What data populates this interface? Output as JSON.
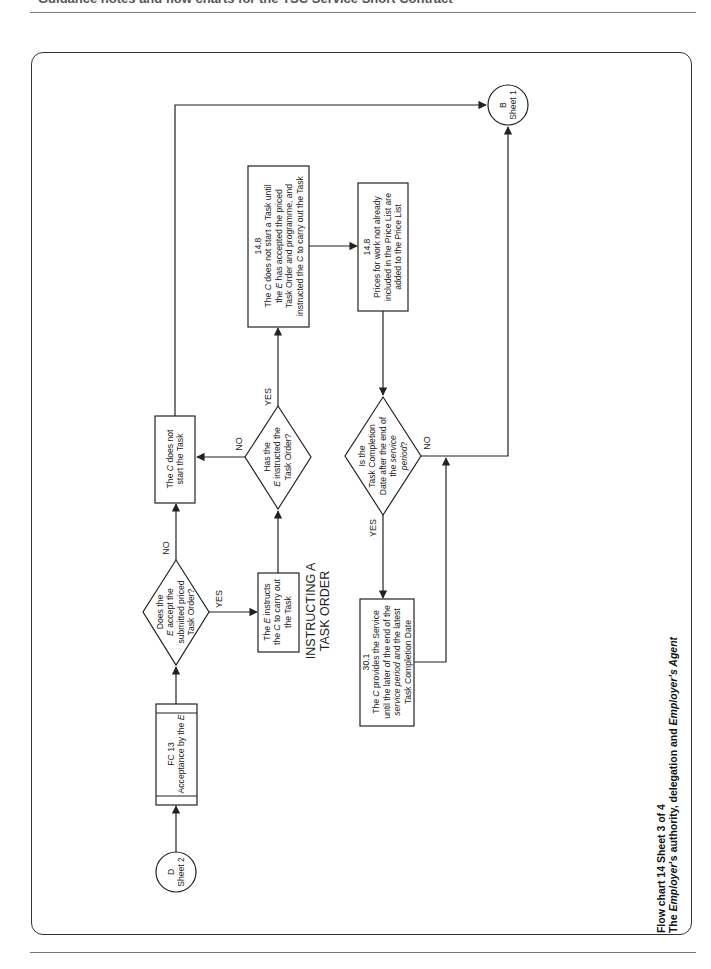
{
  "header": {
    "title": "Guidance notes and flow charts for the TSC Service Short Contract"
  },
  "caption": {
    "line1": "Flow chart 14 Sheet 3 of 4",
    "line2_prefix": "The ",
    "line2_em1": "Employer",
    "line2_mid": "'s authority, delegation and ",
    "line2_em2": "Employer's Agent"
  },
  "connectors": {
    "start": {
      "id": "D",
      "sheet": "Sheet 2"
    },
    "end": {
      "id": "B",
      "sheet": "Sheet 1"
    }
  },
  "nodes": {
    "fc13": {
      "ref": "FC 13",
      "text_prefix": "Acceptance by the ",
      "text_em": "E"
    },
    "decision_accept": {
      "l1": "Does the",
      "l2_em": "E",
      "l2": " accept the",
      "l3": "submitted priced",
      "l4": "Task Order?"
    },
    "not_start": {
      "l1_prefix": "The ",
      "l1_em": "C",
      "l1": " does not",
      "l2": "start the Task"
    },
    "instructs": {
      "l1_prefix": "The ",
      "l1_em": "E",
      "l1": " instructs",
      "l2_prefix": "the ",
      "l2_em": "C",
      "l2": " to carry out",
      "l3": "the Task"
    },
    "section_label": {
      "l1": "INSTRUCTING A",
      "l2": "TASK ORDER"
    },
    "decision_instructed": {
      "l1": "Has the",
      "l2_em": "E",
      "l2": " instructed the",
      "l3": "Task Order?"
    },
    "clause_14_8a": {
      "ref": "14.8",
      "l1_prefix": "The ",
      "l1_em": "C",
      "l1": " does not start a Task until",
      "l2_prefix": "the ",
      "l2_em": "E",
      "l2": " has accepted the priced",
      "l3": "Task Order and programme, and",
      "l4_prefix": "instructed the ",
      "l4_em": "C",
      "l4": " to carry out the Task"
    },
    "clause_14_8b": {
      "ref": "14.8",
      "l1": "Prices for work not already",
      "l2": "included in the Price List are",
      "l3": "added to the Price List"
    },
    "decision_completion": {
      "l1": "Is the",
      "l2": "Task Completion",
      "l3": "Date after the end of",
      "l4_prefix": "the ",
      "l4_em": "service",
      "l5_em": "period",
      "l5": "?"
    },
    "clause_30_1": {
      "ref": "30.1",
      "l1_prefix": "The ",
      "l1_em": "C",
      "l1": " provides the Service",
      "l2": "until the later of the end of the",
      "l3_em": "service period",
      "l3": " and the latest",
      "l4": "Task Completion Date"
    }
  },
  "edge_labels": {
    "accept_yes": "YES",
    "accept_no": "NO",
    "instructed_yes": "YES",
    "instructed_no": "NO",
    "completion_yes": "YES",
    "completion_no": "NO"
  },
  "colors": {
    "line": "#222222",
    "frame": "#333333",
    "rule": "#777777"
  }
}
